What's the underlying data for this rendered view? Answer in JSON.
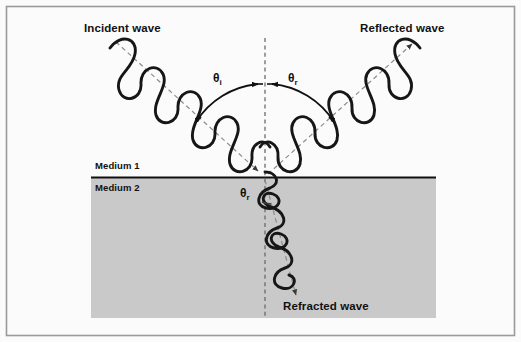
{
  "figure": {
    "background_color": "#fbfbfb",
    "border_color": "#9a9a9a",
    "line_color": "#1a1a1a",
    "medium2_fill": "#c9c9c9"
  },
  "labels": {
    "incident_wave": "Incident wave",
    "reflected_wave": "Reflected wave",
    "refracted_wave": "Refracted wave",
    "medium1": "Medium 1",
    "medium2": "Medium 2"
  },
  "angles": {
    "incident": {
      "symbol": "θ",
      "subscript": "i"
    },
    "reflected": {
      "symbol": "θ",
      "subscript": "r"
    },
    "refracted": {
      "symbol": "θ",
      "subscript": "r"
    }
  },
  "geometry": {
    "interface_y": 177,
    "medium2_rect": {
      "x": 91,
      "y": 178,
      "width": 345,
      "height": 140
    },
    "incidence_point": {
      "x": 265,
      "y": 177
    },
    "normal_line": {
      "x": 265,
      "y_top": 38,
      "y_bottom": 318
    },
    "incident_ray": {
      "x1": 116,
      "y1": 42,
      "x2": 265,
      "y2": 177
    },
    "reflected_ray": {
      "x1": 265,
      "y1": 177,
      "x2": 414,
      "y2": 42
    },
    "refracted_ray": {
      "x1": 265,
      "y1": 177,
      "x2": 297,
      "y2": 297
    }
  }
}
